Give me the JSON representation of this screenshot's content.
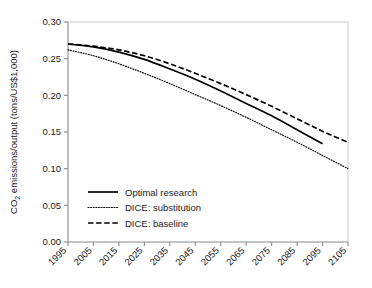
{
  "chart_data": {
    "type": "line",
    "title": "",
    "xlabel": "",
    "ylabel": "CO2 emissions/output (tons/US$1,000)",
    "ylabel_main": "CO",
    "ylabel_sub": "2",
    "ylabel_rest": " emissions/output (tons/US$1,000)",
    "xlim": [
      1995,
      2105
    ],
    "ylim": [
      0.0,
      0.3
    ],
    "grid": false,
    "legend_position": "lower-left-inside",
    "xticks": [
      1995,
      2005,
      2015,
      2025,
      2035,
      2045,
      2055,
      2065,
      2075,
      2085,
      2095,
      2105
    ],
    "xtick_labels": [
      "1995",
      "2005",
      "2015",
      "2025",
      "2035",
      "2045",
      "2055",
      "2065",
      "2075",
      "2085",
      "2095",
      "2105"
    ],
    "yticks": [
      0.0,
      0.05,
      0.1,
      0.15,
      0.2,
      0.25,
      0.3
    ],
    "ytick_labels": [
      "0.00",
      "0.05",
      "0.10",
      "0.15",
      "0.20",
      "0.25",
      "0.30"
    ],
    "x": [
      1995,
      2005,
      2015,
      2025,
      2035,
      2045,
      2055,
      2065,
      2075,
      2085,
      2095,
      2105
    ],
    "series": [
      {
        "name": "Optimal research",
        "style": "solid",
        "color": "#000000",
        "x": [
          1995,
          2005,
          2015,
          2025,
          2035,
          2045,
          2055,
          2065,
          2075,
          2085,
          2095
        ],
        "values": [
          0.27,
          0.266,
          0.259,
          0.249,
          0.236,
          0.222,
          0.206,
          0.189,
          0.172,
          0.153,
          0.134
        ]
      },
      {
        "name": "DICE: substitution",
        "style": "dotted",
        "color": "#000000",
        "x": [
          1995,
          2005,
          2015,
          2025,
          2035,
          2045,
          2055,
          2065,
          2075,
          2085,
          2095,
          2105
        ],
        "values": [
          0.262,
          0.254,
          0.243,
          0.23,
          0.216,
          0.201,
          0.186,
          0.17,
          0.153,
          0.136,
          0.118,
          0.1
        ]
      },
      {
        "name": "DICE: baseline",
        "style": "dashed",
        "color": "#000000",
        "x": [
          1995,
          2005,
          2015,
          2025,
          2035,
          2045,
          2055,
          2065,
          2075,
          2085,
          2095,
          2105
        ],
        "values": [
          0.27,
          0.267,
          0.262,
          0.254,
          0.243,
          0.23,
          0.216,
          0.201,
          0.185,
          0.168,
          0.151,
          0.136
        ]
      }
    ]
  },
  "legend": {
    "items": [
      {
        "label": "Optimal research",
        "style": "solid"
      },
      {
        "label": "DICE: substitution",
        "style": "dotted"
      },
      {
        "label": "DICE: baseline",
        "style": "dashed"
      }
    ]
  },
  "colors": {
    "line": "#000000",
    "axis": "#6e6e6e",
    "text": "#1a1a1a",
    "background": "#ffffff"
  }
}
